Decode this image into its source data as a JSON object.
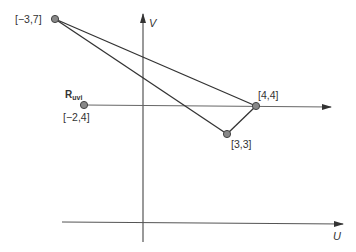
{
  "diagram": {
    "axes": {
      "v_label": "V",
      "u_label": "U"
    },
    "points": [
      {
        "id": "p1",
        "label": "[−3,7]",
        "coord": [
          -3,
          7
        ]
      },
      {
        "id": "p2",
        "label": "[4,4]",
        "coord": [
          4,
          4
        ]
      },
      {
        "id": "p3",
        "label": "[3,3]",
        "coord": [
          3,
          3
        ]
      },
      {
        "id": "p4",
        "label": "[−2,4]",
        "coord": [
          -2,
          4
        ]
      }
    ],
    "ray_label": {
      "main": "R",
      "sub": "uvi"
    },
    "colors": {
      "line": "#333333",
      "point_fill": "#888888",
      "axis": "#444444"
    }
  }
}
